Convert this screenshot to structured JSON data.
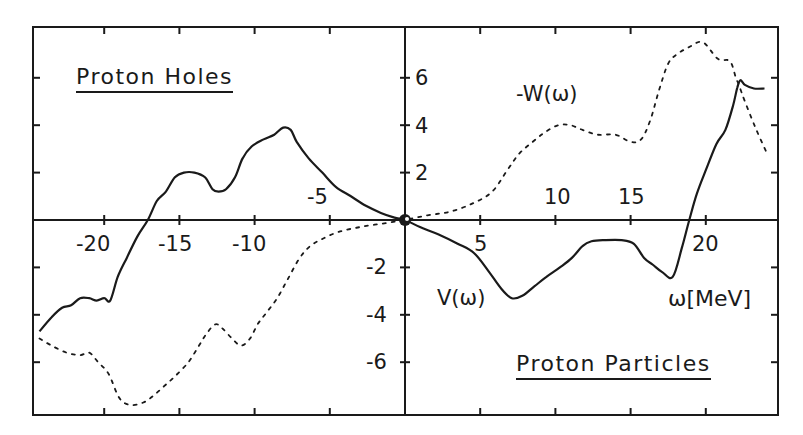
{
  "chart_data": {
    "type": "line",
    "title": "",
    "xlabel": "ω [MeV]",
    "ylabel": "",
    "xlim": [
      -24.8,
      24.7
    ],
    "ylim": [
      -8.2,
      8.2
    ],
    "grid": false,
    "x_ticks": [
      -20,
      -15,
      -10,
      -5,
      5,
      10,
      15,
      20
    ],
    "y_ticks": [
      -6,
      -4,
      -2,
      2,
      4,
      6
    ],
    "x_tick_labels": [
      "-20",
      "-15",
      "-10",
      "-5",
      "5",
      "10",
      "15",
      "20"
    ],
    "y_tick_labels": [
      "-6",
      "-4",
      "-2",
      "2",
      "4",
      "6"
    ],
    "annotations": [
      "Proton Holes",
      "Proton Particles",
      "V(ω)",
      "-W(ω)",
      "ω[MeV]"
    ],
    "legend": "none (series labelled inline)",
    "series": [
      {
        "name": "V(ω)",
        "style": "solid",
        "x": [
          -24.3,
          -23.5,
          -22.8,
          -22.2,
          -21.6,
          -21.0,
          -20.5,
          -20.0,
          -19.6,
          -19.1,
          -18.5,
          -17.8,
          -17.1,
          -16.5,
          -15.9,
          -15.3,
          -14.7,
          -14.0,
          -13.3,
          -12.8,
          -12.4,
          -11.9,
          -11.3,
          -10.8,
          -10.2,
          -9.4,
          -8.7,
          -8.1,
          -7.6,
          -7.2,
          -6.4,
          -5.5,
          -4.6,
          -3.6,
          -2.6,
          -1.6,
          -0.7,
          0.0,
          1.0,
          2.2,
          3.5,
          4.6,
          5.6,
          6.4,
          7.1,
          7.8,
          8.6,
          9.4,
          10.3,
          11.1,
          11.8,
          12.4,
          13.3,
          14.4,
          15.2,
          15.9,
          16.5,
          17.1,
          17.8,
          18.4,
          18.9,
          19.4,
          20.0,
          20.7,
          21.3,
          21.8,
          22.1,
          22.3,
          22.6,
          23.2,
          23.9
        ],
        "y": [
          -4.7,
          -4.1,
          -3.7,
          -3.6,
          -3.3,
          -3.3,
          -3.4,
          -3.3,
          -3.4,
          -2.4,
          -1.6,
          -0.7,
          0.0,
          0.8,
          1.2,
          1.8,
          2.0,
          2.0,
          1.8,
          1.3,
          1.2,
          1.3,
          1.8,
          2.6,
          3.1,
          3.4,
          3.6,
          3.9,
          3.8,
          3.3,
          2.6,
          2.0,
          1.4,
          1.0,
          0.6,
          0.3,
          0.1,
          0.0,
          -0.3,
          -0.6,
          -1.0,
          -1.4,
          -2.2,
          -2.9,
          -3.3,
          -3.2,
          -2.8,
          -2.4,
          -2.0,
          -1.6,
          -1.1,
          -0.9,
          -0.85,
          -0.85,
          -1.0,
          -1.6,
          -1.9,
          -2.2,
          -2.4,
          -1.2,
          0.0,
          1.1,
          2.1,
          3.2,
          3.8,
          4.8,
          5.6,
          5.9,
          5.7,
          5.55,
          5.55
        ]
      },
      {
        "name": "-W(ω)",
        "style": "dotted",
        "x": [
          -24.3,
          -23.5,
          -22.5,
          -21.6,
          -21.0,
          -20.4,
          -19.7,
          -19.0,
          -18.3,
          -17.4,
          -16.7,
          -16.0,
          -15.3,
          -14.4,
          -13.7,
          -13.2,
          -12.6,
          -12.1,
          -11.5,
          -10.9,
          -10.3,
          -9.8,
          -9.2,
          -8.5,
          -7.8,
          -7.0,
          -6.3,
          -5.5,
          -4.4,
          -3.0,
          -1.5,
          0.0,
          1.5,
          3.0,
          4.5,
          5.8,
          6.8,
          7.6,
          8.5,
          9.3,
          10.2,
          11.0,
          11.8,
          12.8,
          14.0,
          15.0,
          15.7,
          16.3,
          16.9,
          17.5,
          18.1,
          18.9,
          19.8,
          20.8,
          21.6,
          22.0,
          22.2,
          22.6,
          23.3,
          24.0
        ],
        "y": [
          -5.0,
          -5.3,
          -5.6,
          -5.7,
          -5.6,
          -6.0,
          -6.5,
          -7.5,
          -7.8,
          -7.7,
          -7.4,
          -7.0,
          -6.6,
          -6.0,
          -5.3,
          -4.8,
          -4.4,
          -4.6,
          -5.0,
          -5.3,
          -5.0,
          -4.4,
          -3.9,
          -3.3,
          -2.5,
          -1.6,
          -1.1,
          -0.8,
          -0.5,
          -0.3,
          -0.15,
          0.0,
          0.2,
          0.35,
          0.7,
          1.2,
          2.1,
          2.8,
          3.3,
          3.7,
          4.0,
          4.0,
          3.8,
          3.6,
          3.6,
          3.3,
          3.4,
          4.2,
          5.5,
          6.6,
          7.0,
          7.3,
          7.5,
          6.8,
          6.7,
          6.0,
          5.7,
          5.0,
          3.9,
          2.9
        ]
      }
    ]
  },
  "labels": {
    "region_top_left": "Proton Holes",
    "region_bottom_right": "Proton Particles",
    "series_v": "V(ω)",
    "series_w": "-W(ω)",
    "x_axis_unit": "ω[MeV]",
    "x_ticks": [
      "-20",
      "-15",
      "-10",
      "-5",
      "5",
      "10",
      "15",
      "20"
    ],
    "y_ticks": [
      "6",
      "4",
      "2",
      "-2",
      "-4",
      "-6"
    ]
  },
  "colors": {
    "ink": "#1a1a1a",
    "background": "#ffffff"
  }
}
